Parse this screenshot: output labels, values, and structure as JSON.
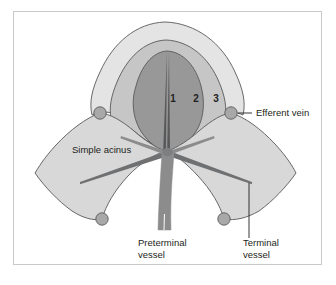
{
  "figure": {
    "zones": [
      {
        "id": "zone-1",
        "label": "1",
        "color": "#989898"
      },
      {
        "id": "zone-2",
        "label": "2",
        "color": "#c6c6c6"
      },
      {
        "id": "zone-3",
        "label": "3",
        "color": "#e4e4e4"
      }
    ],
    "labels": {
      "simple_acinus": "Simple acinus",
      "efferent_vein": "Efferent vein",
      "preterminal_vessel_line1": "Preterminal",
      "preterminal_vessel_line2": "vessel",
      "terminal_vessel_line1": "Terminal",
      "terminal_vessel_line2": "vessel"
    },
    "colors": {
      "background": "#ffffff",
      "frame_border": "#c9c9c9",
      "lobe_fill": "#d8d8d8",
      "zone1_fill": "#989898",
      "zone2_fill": "#c6c6c6",
      "zone3_fill": "#e4e4e4",
      "vessel_fill": "#8c8c8c",
      "node_fill": "#a8a8a8",
      "outline": "#58595b",
      "text": "#231f20"
    },
    "nodes": [
      {
        "name": "efferent-vein-node-top-left",
        "cx": 100,
        "cy": 113
      },
      {
        "name": "efferent-vein-node-top-right",
        "cx": 231,
        "cy": 113
      },
      {
        "name": "efferent-vein-node-bottom-left",
        "cx": 102,
        "cy": 219
      },
      {
        "name": "efferent-vein-node-bottom-right",
        "cx": 224,
        "cy": 219
      }
    ]
  }
}
